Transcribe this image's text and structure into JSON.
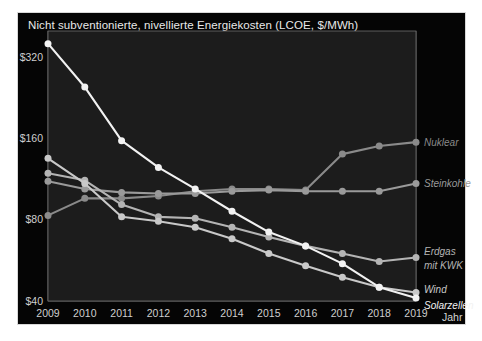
{
  "chart_title": "Nicht subventionierte, nivellierte Energiekosten (LCOE, $/MWh)",
  "axis": {
    "x_name": "Jahr",
    "y_ticks": [
      "$320",
      "$160",
      "$80",
      "$40"
    ],
    "x_ticks": [
      "2009",
      "2010",
      "2011",
      "2012",
      "2013",
      "2014",
      "2015",
      "2016",
      "2017",
      "2018",
      "2019"
    ]
  },
  "colors": {
    "background": "#050505",
    "plot_background": "#1c1c1c",
    "grid": "#6f6f6f",
    "title_text": "#e9e9e9",
    "tick_text": "#cfcfcf",
    "nuklear": "#8a8a8a",
    "steinkohle": "#9a9a9a",
    "erdgas": "#b4b4b4",
    "wind": "#c9c9c9",
    "solarzellen": "#f2f2f2"
  },
  "chart_data": {
    "type": "line",
    "title": "Nicht subventionierte, nivellierte Energiekosten (LCOE, $/MWh)",
    "xlabel": "Jahr",
    "ylabel": "",
    "yscale": "log",
    "ylim": [
      40,
      400
    ],
    "ytick_values": [
      320,
      160,
      80,
      40
    ],
    "grid": true,
    "legend": "right-inline",
    "x": [
      2009,
      2010,
      2011,
      2012,
      2013,
      2014,
      2015,
      2016,
      2017,
      2018,
      2019
    ],
    "series": [
      {
        "name": "Nuklear",
        "color": "#8a8a8a",
        "label_line1": "Nuklear",
        "values": [
          83,
          96,
          96,
          98,
          102,
          104,
          104,
          103,
          140,
          150,
          155
        ]
      },
      {
        "name": "Steinkohle",
        "color": "#9a9a9a",
        "label_line1": "Steinkohle",
        "values": [
          111,
          104,
          101,
          100,
          100,
          102,
          103,
          102,
          102,
          102,
          109
        ]
      },
      {
        "name": "Erdgas mit KWK",
        "color": "#b4b4b4",
        "label_line1": "Erdgas",
        "label_line2": "mit KWK",
        "values": [
          119,
          112,
          91,
          82,
          81,
          75,
          69,
          64,
          60,
          56,
          58
        ]
      },
      {
        "name": "Wind",
        "color": "#c9c9c9",
        "label_line1": "Wind",
        "values": [
          135,
          109,
          82,
          79,
          75,
          68,
          60,
          54,
          49,
          45,
          43
        ]
      },
      {
        "name": "Solarzellen",
        "color": "#f2f2f2",
        "label_line1": "Solarzellen",
        "values": [
          359,
          248,
          157,
          125,
          104,
          86,
          72,
          64,
          55,
          45,
          41
        ]
      }
    ]
  }
}
